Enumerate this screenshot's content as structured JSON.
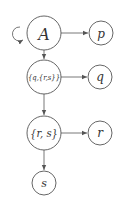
{
  "diagram": {
    "type": "tree",
    "nodes": [
      {
        "id": "A",
        "label": "A",
        "cx": 44,
        "cy": 33,
        "r": 17,
        "size": 16
      },
      {
        "id": "p",
        "label": "p",
        "cx": 101,
        "cy": 33,
        "r": 12,
        "size": 12
      },
      {
        "id": "q_rs",
        "label": "{q,{r,s}}",
        "cx": 44,
        "cy": 77,
        "r": 17,
        "size": 7.5
      },
      {
        "id": "q",
        "label": "q",
        "cx": 100,
        "cy": 77,
        "r": 12,
        "size": 12
      },
      {
        "id": "rs",
        "label": "{r, s}",
        "cx": 44,
        "cy": 133,
        "r": 17,
        "size": 11
      },
      {
        "id": "r",
        "label": "r",
        "cx": 100,
        "cy": 133,
        "r": 12,
        "size": 12
      },
      {
        "id": "s",
        "label": "s",
        "cx": 44,
        "cy": 183,
        "r": 12,
        "size": 11
      }
    ],
    "edges": [
      {
        "from": "A",
        "to": "A",
        "kind": "self-loop"
      },
      {
        "from": "A",
        "to": "p"
      },
      {
        "from": "A",
        "to": "q_rs"
      },
      {
        "from": "q_rs",
        "to": "q"
      },
      {
        "from": "q_rs",
        "to": "rs"
      },
      {
        "from": "rs",
        "to": "r"
      },
      {
        "from": "rs",
        "to": "s"
      }
    ],
    "colors": {
      "stroke": "#555555",
      "text": "#333333",
      "background": "#ffffff"
    }
  }
}
